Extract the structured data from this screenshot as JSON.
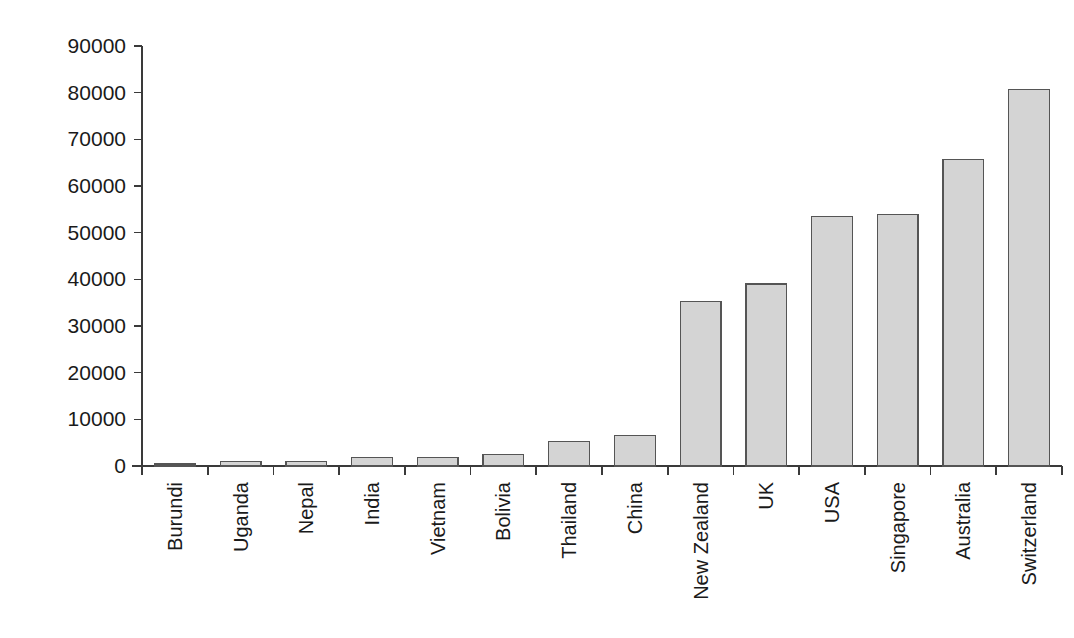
{
  "chart_data": {
    "type": "bar",
    "title": "",
    "subtitle": "",
    "xlabel": "",
    "ylabel": "",
    "categories": [
      "Burundi",
      "Uganda",
      "Nepal",
      "India",
      "Vietnam",
      "Bolivia",
      "Thailand",
      "China",
      "New Zealand",
      "UK",
      "USA",
      "Singapore",
      "Australia",
      "Switzerland"
    ],
    "values": [
      400,
      900,
      950,
      1800,
      1800,
      2500,
      5300,
      6500,
      35200,
      39000,
      53500,
      53900,
      65700,
      80700
    ],
    "series": [
      {
        "name": "",
        "values": [
          400,
          900,
          950,
          1800,
          1800,
          2500,
          5300,
          6500,
          35200,
          39000,
          53500,
          53900,
          65700,
          80700
        ]
      }
    ],
    "ylim": [
      0,
      90000
    ],
    "y_ticks": [
      0,
      10000,
      20000,
      30000,
      40000,
      50000,
      60000,
      70000,
      80000,
      90000
    ],
    "y_tick_labels": [
      "0",
      "10000",
      "20000",
      "30000",
      "40000",
      "50000",
      "60000",
      "70000",
      "80000",
      "90000"
    ],
    "grid": false,
    "legend": false,
    "legend_position": "none",
    "bar_color": "#d4d4d4",
    "bar_edge_color": "#555555",
    "axis_color": "#3a3a3a",
    "x_tick_label_rotation": 90,
    "background": "#ffffff"
  }
}
